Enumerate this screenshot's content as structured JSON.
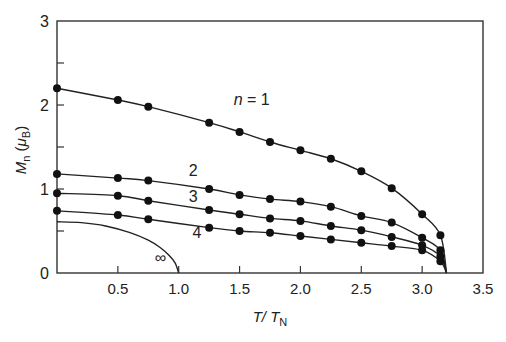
{
  "chart_data": {
    "type": "line",
    "title": "",
    "xlabel": "T/T_N",
    "xlabel_parts": {
      "main": "T/ T",
      "sub": "N"
    },
    "ylabel": "M_n (μ_B)",
    "ylabel_parts": {
      "main": "M",
      "sub": "n",
      "paren_open": " (",
      "mu": "μ",
      "mu_sub": "B",
      "paren_close": ")"
    },
    "xlim": [
      0,
      3.5
    ],
    "ylim": [
      0,
      3
    ],
    "xticks": [
      0.5,
      1.0,
      1.5,
      2.0,
      2.5,
      3.0,
      3.5
    ],
    "xtick_labels": [
      "0.5",
      "1.0",
      "1.5",
      "2.0",
      "2.5",
      "3.0",
      "3.5"
    ],
    "yticks": [
      0,
      1,
      2,
      3
    ],
    "ytick_labels": [
      "0",
      "1",
      "2",
      "3"
    ],
    "y_minor_ticks": [
      0.5,
      1.5,
      2.5
    ],
    "grid": false,
    "legend": "inline labels",
    "series": [
      {
        "name": "n = 1",
        "label": "n = 1",
        "markers": true,
        "x": [
          0,
          0.5,
          0.75,
          1.25,
          1.5,
          1.75,
          2.0,
          2.25,
          2.5,
          2.75,
          3.0,
          3.15
        ],
        "values": [
          2.2,
          2.06,
          1.98,
          1.79,
          1.68,
          1.56,
          1.46,
          1.36,
          1.21,
          1.01,
          0.7,
          0.45
        ],
        "curve_end": [
          3.2,
          0
        ]
      },
      {
        "name": "n = 2",
        "label": "2",
        "markers": true,
        "x": [
          0,
          0.5,
          0.75,
          1.25,
          1.5,
          1.75,
          2.0,
          2.25,
          2.5,
          2.75,
          3.0,
          3.15
        ],
        "values": [
          1.18,
          1.13,
          1.1,
          1.0,
          0.93,
          0.88,
          0.85,
          0.79,
          0.68,
          0.6,
          0.42,
          0.27
        ],
        "curve_end": [
          3.2,
          0
        ]
      },
      {
        "name": "n = 3",
        "label": "3",
        "markers": true,
        "x": [
          0,
          0.5,
          0.75,
          1.25,
          1.5,
          1.75,
          2.0,
          2.25,
          2.5,
          2.75,
          3.0,
          3.15
        ],
        "values": [
          0.95,
          0.92,
          0.86,
          0.75,
          0.7,
          0.65,
          0.62,
          0.56,
          0.51,
          0.43,
          0.33,
          0.2
        ],
        "curve_end": [
          3.2,
          0
        ]
      },
      {
        "name": "n = 4",
        "label": "4",
        "markers": true,
        "x": [
          0,
          0.5,
          0.75,
          1.25,
          1.5,
          1.75,
          2.0,
          2.25,
          2.5,
          2.75,
          3.0,
          3.15
        ],
        "values": [
          0.74,
          0.69,
          0.64,
          0.54,
          0.5,
          0.48,
          0.44,
          0.4,
          0.36,
          0.32,
          0.27,
          0.14
        ],
        "curve_end": [
          3.2,
          0
        ]
      },
      {
        "name": "n = ∞",
        "label": "∞",
        "markers": false,
        "x": [
          0,
          0.2,
          0.4,
          0.6,
          0.75,
          0.85,
          0.92,
          0.97,
          1.0
        ],
        "values": [
          0.61,
          0.6,
          0.56,
          0.48,
          0.39,
          0.3,
          0.21,
          0.12,
          0
        ],
        "curve_end": [
          1.0,
          0
        ]
      }
    ],
    "annotations": [
      {
        "text": "n = 1",
        "x": 1.6,
        "y": 2.0
      },
      {
        "text": "2",
        "x": 1.12,
        "y": 1.15
      },
      {
        "text": "3",
        "x": 1.12,
        "y": 0.85
      },
      {
        "text": "4",
        "x": 1.15,
        "y": 0.42
      },
      {
        "text": "∞",
        "x": 0.85,
        "y": 0.12
      }
    ],
    "colors": {
      "line": "#222222",
      "marker": "#111111",
      "axis": "#333333",
      "background": "#ffffff"
    }
  }
}
